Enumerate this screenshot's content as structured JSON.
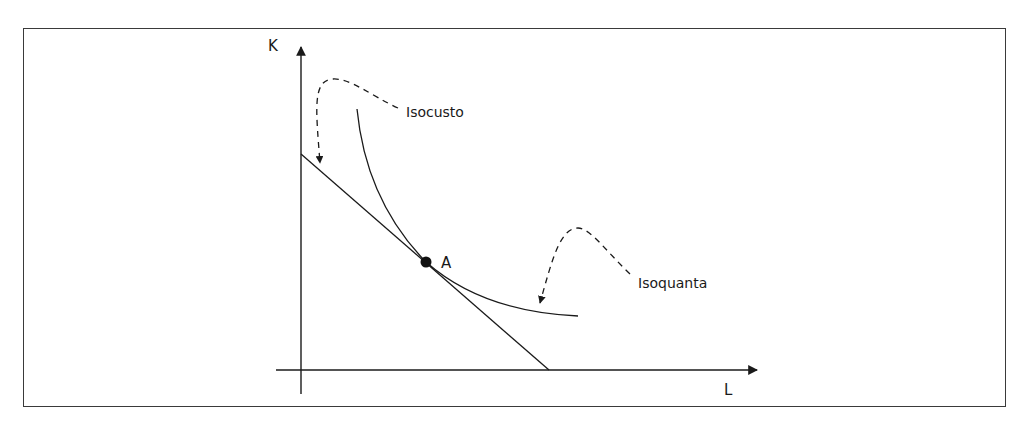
{
  "figure": {
    "axes": {
      "y_label": "K",
      "x_label": "L"
    },
    "curves": {
      "isocost_label": "Isocusto",
      "isoquant_label": "Isoquanta"
    },
    "point": {
      "label": "A"
    }
  },
  "colors": {
    "line": "#1a1a1a",
    "frame": "#3a3a3a",
    "background": "#ffffff"
  }
}
